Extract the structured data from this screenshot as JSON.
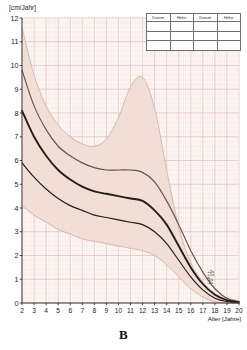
{
  "figure": {
    "caption": "B",
    "title": ""
  },
  "axes": {
    "y_unit_label": "[cm/Jahr]",
    "x_axis_title": "Alter [Jahre]",
    "y_ticks": [
      "0",
      "1",
      "2",
      "3",
      "4",
      "5",
      "6",
      "7",
      "8",
      "9",
      "10",
      "11",
      "12"
    ],
    "x_ticks": [
      "2",
      "3",
      "4",
      "5",
      "6",
      "7",
      "8",
      "9",
      "10",
      "11",
      "12",
      "13",
      "14",
      "15",
      "16",
      "17",
      "18",
      "19",
      "20"
    ]
  },
  "band_labels": {
    "plus2s": "+2s",
    "plus1s": "+1s",
    "mean": "x̄",
    "minus1s": "-1s",
    "minus2s": "-2s"
  },
  "record_table": {
    "headers": [
      "Datum",
      "Höhe",
      "Datum",
      "Höhe"
    ],
    "rows": [
      [
        "",
        "",
        "",
        ""
      ],
      [
        "",
        "",
        "",
        ""
      ],
      [
        "",
        "",
        "",
        ""
      ]
    ]
  },
  "colors": {
    "band_fill": "#f0ddd5",
    "grid_minor": "#f3dcd6",
    "grid_major": "#e3bcb2",
    "curve_dark": "#241a16",
    "curve_mid": "#6b5248",
    "curve_light": "#c9a298",
    "axis": "#2b2b2b",
    "plot_background": "#fdf8f6"
  },
  "chart_data": {
    "type": "line",
    "title": "",
    "subtitle": "",
    "xlabel": "Alter [Jahre]",
    "ylabel": "[cm/Jahr]",
    "xlim": [
      2,
      20
    ],
    "ylim": [
      0,
      12
    ],
    "grid": true,
    "legend_position": "inside-bottom-right",
    "x": [
      2,
      3,
      4,
      5,
      6,
      7,
      8,
      9,
      10,
      11,
      12,
      13,
      14,
      15,
      16,
      17,
      18,
      19,
      20
    ],
    "series": [
      {
        "name": "+2s",
        "label": "+2s",
        "style": "dotted",
        "color": "#c9a298",
        "values": [
          11.6,
          9.6,
          8.3,
          7.5,
          7.0,
          6.7,
          6.6,
          6.9,
          7.8,
          9.1,
          9.5,
          8.2,
          5.6,
          3.2,
          1.7,
          0.9,
          0.4,
          0.2,
          0.1
        ]
      },
      {
        "name": "+1s",
        "label": "+1s",
        "style": "solid",
        "color": "#6b5248",
        "values": [
          9.8,
          8.3,
          7.3,
          6.6,
          6.2,
          5.9,
          5.7,
          5.6,
          5.6,
          5.6,
          5.5,
          5.1,
          4.3,
          3.3,
          2.2,
          1.3,
          0.6,
          0.2,
          0.05
        ]
      },
      {
        "name": "x̄",
        "label": "x̄",
        "style": "solid-thick",
        "color": "#241a16",
        "values": [
          8.1,
          7.0,
          6.2,
          5.6,
          5.2,
          4.9,
          4.7,
          4.6,
          4.5,
          4.4,
          4.3,
          3.9,
          3.3,
          2.4,
          1.5,
          0.8,
          0.35,
          0.12,
          0.03
        ]
      },
      {
        "name": "-1s",
        "label": "-1s",
        "style": "solid",
        "color": "#241a16",
        "values": [
          5.9,
          5.3,
          4.8,
          4.4,
          4.1,
          3.9,
          3.7,
          3.6,
          3.5,
          3.4,
          3.3,
          3.0,
          2.5,
          1.8,
          1.1,
          0.55,
          0.2,
          0.06,
          0.0
        ]
      },
      {
        "name": "-2s",
        "label": "-2s",
        "style": "dotted",
        "color": "#c9a298",
        "values": [
          4.1,
          3.7,
          3.4,
          3.1,
          2.9,
          2.7,
          2.6,
          2.5,
          2.4,
          2.3,
          2.2,
          2.0,
          1.6,
          1.1,
          0.6,
          0.25,
          0.05,
          0.0,
          0.0
        ]
      }
    ]
  }
}
